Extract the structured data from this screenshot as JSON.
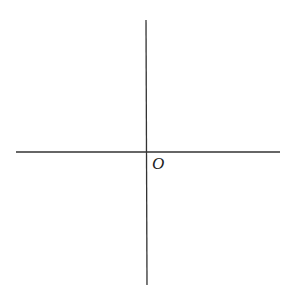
{
  "diagram": {
    "type": "coordinate-axes",
    "origin_label": "O",
    "line_color": "#333333",
    "background": "#ffffff",
    "x_axis": {
      "x1": 16,
      "y1": 152,
      "x2": 280,
      "y2": 152
    },
    "y_axis": {
      "x1": 146,
      "y1": 20,
      "x2": 147,
      "y2": 285
    }
  }
}
